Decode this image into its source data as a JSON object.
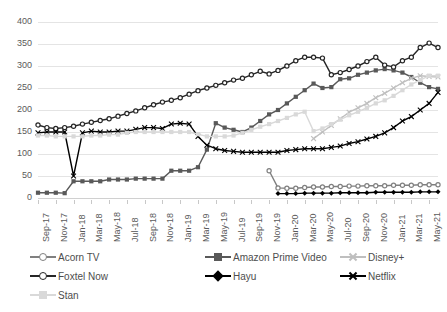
{
  "chart_data": {
    "type": "line",
    "title": "",
    "xlabel": "",
    "ylabel": "",
    "ylim": [
      0,
      400
    ],
    "ytick_step": 50,
    "grid": true,
    "legend_position": "bottom",
    "ticks": {
      "y": [
        "0",
        "50",
        "100",
        "150",
        "200",
        "250",
        "300",
        "350",
        "400"
      ],
      "x": [
        "Sep-17",
        "Nov-17",
        "Jan-18",
        "Mar-18",
        "May-18",
        "Jul-18",
        "Sep-18",
        "Nov-18",
        "Jan-19",
        "Mar-19",
        "May-19",
        "Jul-19",
        "Sep-19",
        "Nov-19",
        "Jan-20",
        "Mar-20",
        "May-20",
        "Jul-20",
        "Sep-20",
        "Nov-20",
        "Jan-21",
        "Mar-21",
        "May-21"
      ]
    },
    "x": [
      "Sep-17",
      "Oct-17",
      "Nov-17",
      "Dec-17",
      "Jan-18",
      "Feb-18",
      "Mar-18",
      "Apr-18",
      "May-18",
      "Jun-18",
      "Jul-18",
      "Aug-18",
      "Sep-18",
      "Oct-18",
      "Nov-18",
      "Dec-18",
      "Jan-19",
      "Feb-19",
      "Mar-19",
      "Apr-19",
      "May-19",
      "Jun-19",
      "Jul-19",
      "Aug-19",
      "Sep-19",
      "Oct-19",
      "Nov-19",
      "Dec-19",
      "Jan-20",
      "Feb-20",
      "Mar-20",
      "Apr-20",
      "May-20",
      "Jun-20",
      "Jul-20",
      "Aug-20",
      "Sep-20",
      "Oct-20",
      "Nov-20",
      "Dec-20",
      "Jan-21",
      "Feb-21",
      "Mar-21",
      "Apr-21",
      "May-21",
      "Jun-21"
    ],
    "series": [
      {
        "name": "Acorn TV",
        "color": "#808080",
        "marker": "circle",
        "values": [
          null,
          null,
          null,
          null,
          null,
          null,
          null,
          null,
          null,
          null,
          null,
          null,
          null,
          null,
          null,
          null,
          null,
          null,
          null,
          null,
          null,
          null,
          null,
          null,
          null,
          null,
          62,
          23,
          22,
          22,
          24,
          25,
          25,
          26,
          26,
          27,
          27,
          28,
          28,
          28,
          29,
          29,
          29,
          30,
          30,
          30
        ]
      },
      {
        "name": "Amazon Prime Video",
        "color": "#595959",
        "marker": "square",
        "values": [
          12,
          12,
          12,
          11,
          38,
          38,
          38,
          38,
          42,
          42,
          42,
          44,
          44,
          44,
          44,
          62,
          62,
          62,
          70,
          110,
          170,
          160,
          155,
          150,
          160,
          175,
          190,
          200,
          215,
          230,
          245,
          260,
          250,
          252,
          270,
          272,
          280,
          285,
          290,
          293,
          290,
          285,
          275,
          262,
          252,
          248
        ]
      },
      {
        "name": "Disney+",
        "color": "#bfbfbf",
        "marker": "x",
        "values": [
          null,
          null,
          null,
          null,
          null,
          null,
          null,
          null,
          null,
          null,
          null,
          null,
          null,
          null,
          null,
          null,
          null,
          null,
          null,
          null,
          null,
          null,
          null,
          null,
          null,
          null,
          null,
          null,
          null,
          null,
          null,
          135,
          150,
          165,
          180,
          195,
          205,
          215,
          228,
          238,
          250,
          262,
          272,
          278,
          276,
          275
        ]
      },
      {
        "name": "Foxtel Now",
        "color": "#262626",
        "marker": "circle",
        "values": [
          166,
          160,
          158,
          160,
          163,
          168,
          172,
          176,
          180,
          186,
          192,
          198,
          205,
          212,
          218,
          222,
          228,
          236,
          244,
          250,
          256,
          262,
          268,
          272,
          280,
          288,
          282,
          290,
          300,
          312,
          320,
          320,
          318,
          280,
          285,
          292,
          300,
          310,
          320,
          302,
          298,
          312,
          320,
          342,
          352,
          342
        ]
      },
      {
        "name": "Hayu",
        "color": "#000000",
        "marker": "diamond",
        "values": [
          null,
          null,
          null,
          null,
          null,
          null,
          null,
          null,
          null,
          null,
          null,
          null,
          null,
          null,
          null,
          null,
          null,
          null,
          null,
          null,
          null,
          null,
          null,
          null,
          null,
          null,
          null,
          10,
          10,
          10,
          11,
          11,
          11,
          11,
          12,
          12,
          12,
          12,
          13,
          13,
          13,
          13,
          13,
          14,
          14,
          14
        ]
      },
      {
        "name": "Netflix",
        "color": "#000000",
        "marker": "x",
        "values": [
          148,
          150,
          150,
          150,
          50,
          148,
          152,
          150,
          150,
          152,
          152,
          156,
          160,
          160,
          158,
          168,
          170,
          168,
          140,
          120,
          112,
          108,
          106,
          104,
          104,
          104,
          104,
          104,
          108,
          110,
          112,
          112,
          112,
          115,
          118,
          124,
          128,
          134,
          140,
          148,
          160,
          175,
          185,
          200,
          215,
          240
        ]
      },
      {
        "name": "Stan",
        "color": "#d9d9d9",
        "marker": "square",
        "values": [
          142,
          142,
          140,
          140,
          140,
          140,
          142,
          142,
          144,
          144,
          148,
          150,
          150,
          150,
          150,
          150,
          150,
          150,
          145,
          140,
          140,
          140,
          142,
          148,
          155,
          162,
          168,
          175,
          182,
          190,
          196,
          152,
          158,
          168,
          178,
          188,
          196,
          205,
          215,
          222,
          232,
          245,
          258,
          268,
          278,
          278
        ]
      }
    ]
  }
}
